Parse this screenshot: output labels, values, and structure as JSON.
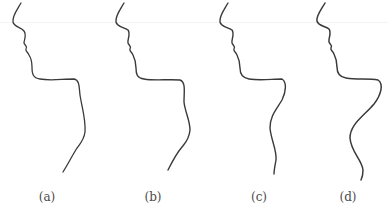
{
  "figure": {
    "stroke_color": "#3a3a3a",
    "label_color": "#4a4a4a",
    "panels": [
      {
        "id": "a",
        "label": "(a)"
      },
      {
        "id": "b",
        "label": "(b)"
      },
      {
        "id": "c",
        "label": "(c)"
      },
      {
        "id": "d",
        "label": "(d)"
      }
    ]
  }
}
